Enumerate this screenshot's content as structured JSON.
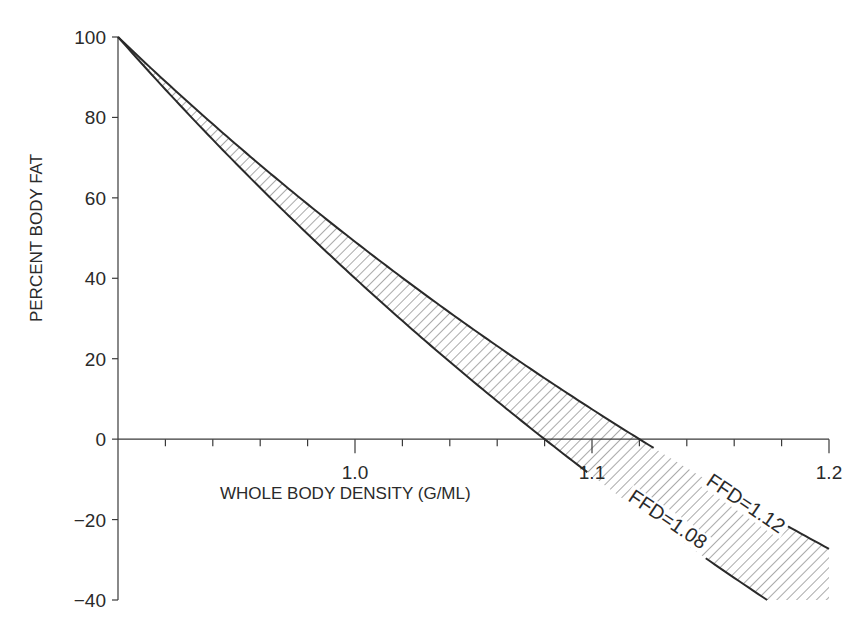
{
  "chart_data": {
    "type": "line",
    "title": "",
    "xlabel": "WHOLE BODY DENSITY (G/ML)",
    "ylabel": "PERCENT BODY FAT",
    "xlim": [
      0.9,
      1.2
    ],
    "ylim": [
      -40,
      100
    ],
    "x_ticks_major": [
      1.0,
      1.1,
      1.2
    ],
    "x_tick_labels": [
      "1.0",
      "1.1",
      "1.2"
    ],
    "x_ticks_minor_step": 0.02,
    "y_ticks": [
      100,
      80,
      60,
      40,
      20,
      0,
      -20,
      -40
    ],
    "y_tick_labels": [
      "100",
      "80",
      "60",
      "40",
      "20",
      "0",
      "−20",
      "−40"
    ],
    "grid": false,
    "legend": null,
    "fill_between": "hatched",
    "series": [
      {
        "name": "FFD=1.12",
        "ffd": 1.12,
        "x": [
          0.9,
          0.95,
          1.0,
          1.05,
          1.1,
          1.12,
          1.15,
          1.2
        ],
        "values": [
          100,
          78.1,
          59.0,
          40.3,
          7.4,
          0,
          -10.6,
          -27.3
        ]
      },
      {
        "name": "FFD=1.08",
        "ffd": 1.08,
        "x": [
          0.9,
          0.95,
          1.0,
          1.05,
          1.08,
          1.1,
          1.15,
          1.174
        ],
        "values": [
          100,
          73.7,
          50.0,
          28.6,
          0,
          -10.1,
          -30.4,
          -40
        ]
      }
    ],
    "annotations": [
      {
        "text": "FFD=1.12",
        "near_x": 1.15,
        "near_y": -12
      },
      {
        "text": "FFD=1.08",
        "near_x": 1.12,
        "near_y": -20
      }
    ]
  },
  "labels": {
    "ylabel": "PERCENT BODY FAT",
    "xlabel": "WHOLE BODY DENSITY (G/ML)",
    "annot_upper": "FFD=1.12",
    "annot_lower": "FFD=1.08"
  }
}
